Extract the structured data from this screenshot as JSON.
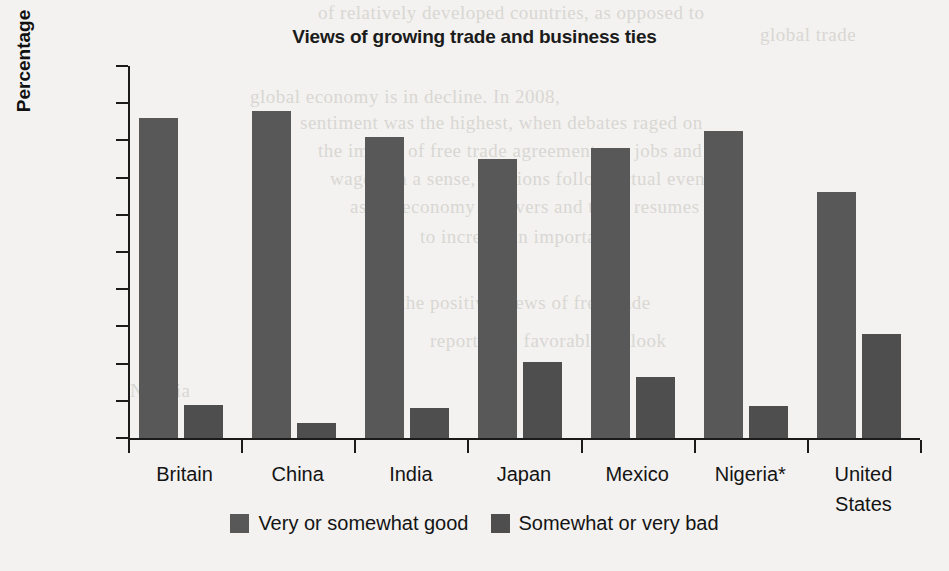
{
  "chart_data": {
    "type": "bar",
    "title": "Views of growing trade and business ties",
    "xlabel": "",
    "ylabel": "Percentage",
    "ylim": [
      0,
      100
    ],
    "yticks": [
      0,
      10,
      20,
      30,
      40,
      50,
      60,
      70,
      80,
      90,
      100
    ],
    "grid": false,
    "legend_position": "bottom-center",
    "categories": [
      "Britain",
      "China",
      "India",
      "Japan",
      "Mexico",
      "Nigeria*",
      "United States"
    ],
    "category_lines": [
      [
        "Britain"
      ],
      [
        "China"
      ],
      [
        "India"
      ],
      [
        "Japan"
      ],
      [
        "Mexico"
      ],
      [
        "Nigeria*"
      ],
      [
        "United",
        "States"
      ]
    ],
    "series": [
      {
        "name": "Very or somewhat good",
        "color": "#585858",
        "values": [
          86,
          88,
          81,
          75,
          78,
          82.5,
          66
        ]
      },
      {
        "name": "Somewhat or very bad",
        "color": "#4e4e4e",
        "values": [
          9,
          4,
          8,
          20.5,
          16.5,
          8.5,
          28
        ]
      }
    ]
  },
  "background_ghost_text": [
    {
      "text": "of relatively developed countries, as opposed to",
      "x": 318,
      "y": 2
    },
    {
      "text": "global trade",
      "x": 760,
      "y": 24
    },
    {
      "text": "global economy is in decline. In 2008,",
      "x": 250,
      "y": 86
    },
    {
      "text": "sentiment was the highest, when debates raged on",
      "x": 300,
      "y": 112
    },
    {
      "text": "the impact of free trade agreements on jobs and",
      "x": 318,
      "y": 140
    },
    {
      "text": "wages. In a sense, opinions follow actual events",
      "x": 330,
      "y": 168
    },
    {
      "text": "as the economy recovers and trade resumes",
      "x": 350,
      "y": 196
    },
    {
      "text": "to increase in importance",
      "x": 420,
      "y": 226
    },
    {
      "text": "the positive views of free trade",
      "x": 400,
      "y": 292
    },
    {
      "text": "reporting a favorable outlook",
      "x": 430,
      "y": 330
    },
    {
      "text": "Nigeria",
      "x": 130,
      "y": 380
    }
  ]
}
